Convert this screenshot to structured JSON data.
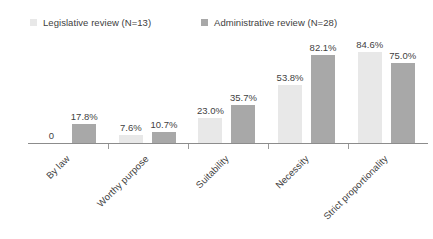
{
  "legend": {
    "entries": [
      {
        "label": "Legislative review (N=13)",
        "color": "#e8e8e8",
        "icon": "legend-swatch-square"
      },
      {
        "label": "Administrative review (N=28)",
        "color": "#a8a8a8",
        "icon": "legend-swatch-square"
      }
    ]
  },
  "chart_data": {
    "type": "bar",
    "title": "",
    "subtitle": "",
    "xlabel": "",
    "ylabel": "",
    "ylim": [
      0,
      100
    ],
    "grid": false,
    "legend_position": "top",
    "categories": [
      "By law",
      "Worthy purpose",
      "Suitability",
      "Necessity",
      "Strict proportionality"
    ],
    "series": [
      {
        "name": "Legislative review (N=13)",
        "color": "#e8e8e8",
        "values": [
          0,
          7.6,
          23.0,
          53.8,
          84.6
        ],
        "labels": [
          "0",
          "7.6%",
          "23.0%",
          "53.8%",
          "84.6%"
        ]
      },
      {
        "name": "Administrative review (N=28)",
        "color": "#a8a8a8",
        "values": [
          17.8,
          10.7,
          35.7,
          82.1,
          75.0
        ],
        "labels": [
          "17.8%",
          "10.7%",
          "35.7%",
          "82.1%",
          "75.0%"
        ]
      }
    ]
  },
  "axis": {
    "line_color": "#8c8c8c",
    "tick_color": "#9a9a9a"
  }
}
